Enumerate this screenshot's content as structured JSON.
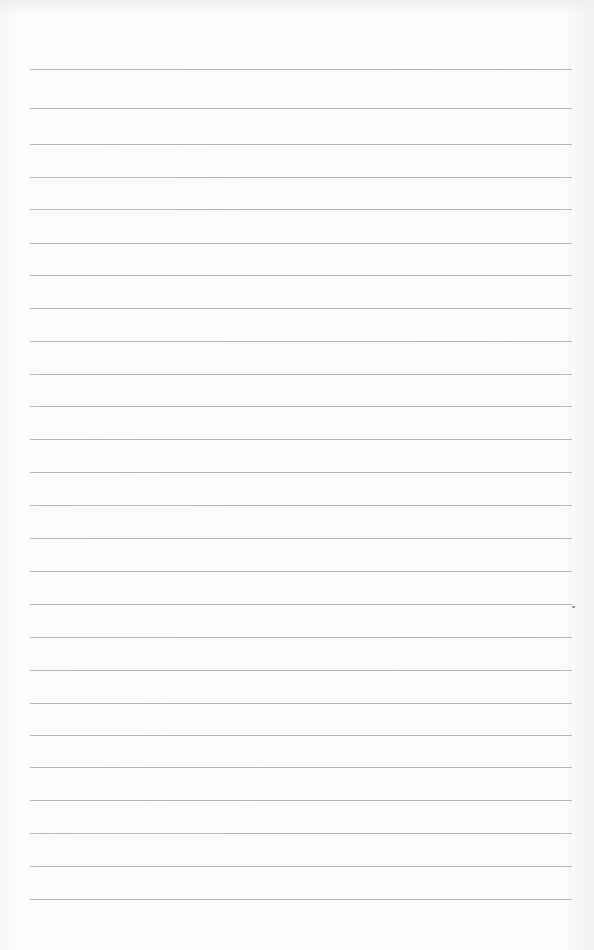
{
  "page": {
    "type": "lined-paper",
    "background_color": "#fbfbfa",
    "rule_color": "#a9a9a7",
    "rule_count": 26,
    "rule_left_px": 30,
    "rule_right_px": 572,
    "rule_positions_px": [
      69,
      108,
      144,
      177,
      209,
      243,
      275,
      308,
      341,
      374,
      406,
      439,
      472,
      505,
      538,
      571,
      604,
      637,
      670,
      703,
      735,
      767,
      800,
      833,
      866,
      899
    ],
    "text_lines": []
  }
}
